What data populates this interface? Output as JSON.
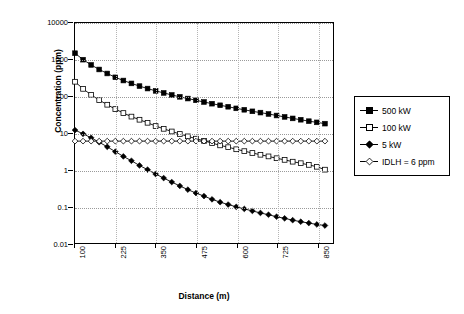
{
  "chart_data": {
    "type": "line",
    "title": "",
    "xlabel": "Distance (m)",
    "ylabel": "Concentration (ppm)",
    "xlim": [
      100,
      900
    ],
    "ylim": [
      0.01,
      10000
    ],
    "yscale": "log",
    "grid": true,
    "legend_position": "right",
    "ytick_labels": [
      "0.01",
      "0.1",
      "1",
      "10",
      "100",
      "1000",
      "10000"
    ],
    "ytick_values": [
      0.01,
      0.1,
      1,
      10,
      100,
      1000,
      10000
    ],
    "xtick_labels": [
      "100",
      "225",
      "350",
      "475",
      "600",
      "725",
      "850"
    ],
    "xtick_values": [
      100,
      225,
      350,
      475,
      600,
      725,
      850
    ],
    "x": [
      100,
      125,
      150,
      175,
      200,
      225,
      250,
      275,
      300,
      325,
      350,
      375,
      400,
      425,
      450,
      475,
      500,
      525,
      550,
      575,
      600,
      625,
      650,
      675,
      700,
      725,
      750,
      775,
      800,
      825,
      850,
      875
    ],
    "series": [
      {
        "name": "500 kW",
        "marker": "filled-square",
        "values": [
          1500,
          1000,
          720,
          540,
          420,
          330,
          270,
          225,
          190,
          163,
          141,
          124,
          109,
          97,
          87,
          78,
          70,
          63,
          57,
          52,
          47,
          43,
          39,
          36,
          33,
          30,
          27.5,
          25,
          23,
          21,
          19.5,
          18
        ]
      },
      {
        "name": "100 kW",
        "marker": "open-square",
        "values": [
          250,
          160,
          110,
          79,
          59,
          45,
          35,
          28,
          23,
          19,
          15.5,
          13,
          11,
          9.4,
          8.1,
          7.0,
          6.1,
          5.3,
          4.6,
          4.1,
          3.6,
          3.2,
          2.85,
          2.55,
          2.3,
          2.05,
          1.85,
          1.65,
          1.5,
          1.35,
          1.2,
          1.0
        ]
      },
      {
        "name": "5 kW",
        "marker": "filled-diamond",
        "values": [
          12,
          9.5,
          7.4,
          5.6,
          4.2,
          3.1,
          2.3,
          1.75,
          1.3,
          1.0,
          0.76,
          0.59,
          0.46,
          0.36,
          0.285,
          0.23,
          0.19,
          0.155,
          0.13,
          0.112,
          0.097,
          0.085,
          0.075,
          0.066,
          0.059,
          0.052,
          0.047,
          0.042,
          0.038,
          0.035,
          0.032,
          0.03
        ]
      },
      {
        "name": "IDLH = 6 ppm",
        "marker": "open-diamond",
        "values": [
          6,
          6,
          6,
          6,
          6,
          6,
          6,
          6,
          6,
          6,
          6,
          6,
          6,
          6,
          6,
          6,
          6,
          6,
          6,
          6,
          6,
          6,
          6,
          6,
          6,
          6,
          6,
          6,
          6,
          6,
          6,
          6
        ]
      }
    ]
  },
  "legend": {
    "items": [
      {
        "label": "500 kW"
      },
      {
        "label": "100 kW"
      },
      {
        "label": "5 kW"
      },
      {
        "label": "IDLH = 6 ppm"
      }
    ]
  },
  "axes": {
    "x_title": "Distance (m)",
    "y_title": "Concentration (ppm)"
  }
}
